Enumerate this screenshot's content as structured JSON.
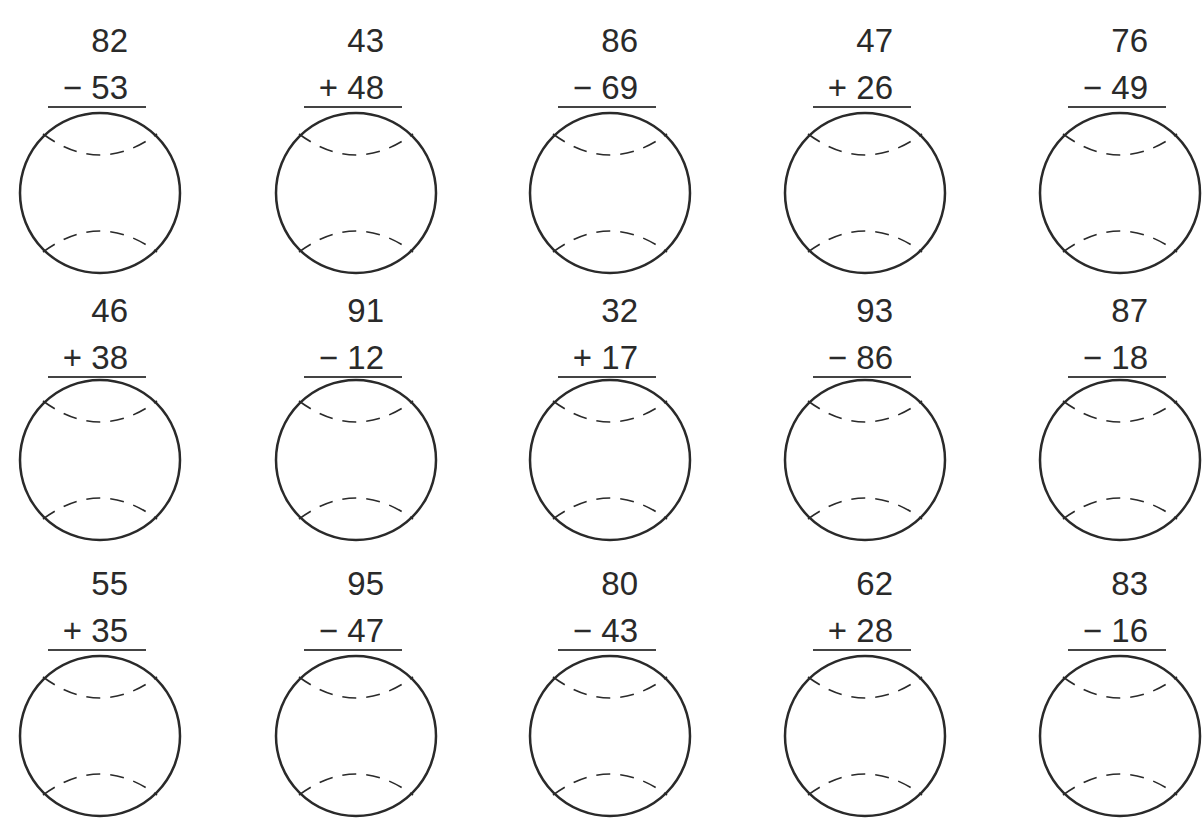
{
  "worksheet": {
    "type": "baseball two-digit addition and subtraction",
    "rows": [
      [
        {
          "top": "82",
          "operator": "−",
          "bottom": "53"
        },
        {
          "top": "43",
          "operator": "+",
          "bottom": "48"
        },
        {
          "top": "86",
          "operator": "−",
          "bottom": "69"
        },
        {
          "top": "47",
          "operator": "+",
          "bottom": "26"
        },
        {
          "top": "76",
          "operator": "−",
          "bottom": "49"
        }
      ],
      [
        {
          "top": "46",
          "operator": "+",
          "bottom": "38"
        },
        {
          "top": "91",
          "operator": "−",
          "bottom": "12"
        },
        {
          "top": "32",
          "operator": "+",
          "bottom": "17"
        },
        {
          "top": "93",
          "operator": "−",
          "bottom": "86"
        },
        {
          "top": "87",
          "operator": "−",
          "bottom": "18"
        }
      ],
      [
        {
          "top": "55",
          "operator": "+",
          "bottom": "35"
        },
        {
          "top": "95",
          "operator": "−",
          "bottom": "47"
        },
        {
          "top": "80",
          "operator": "−",
          "bottom": "43"
        },
        {
          "top": "62",
          "operator": "+",
          "bottom": "28"
        },
        {
          "top": "83",
          "operator": "−",
          "bottom": "16"
        }
      ]
    ],
    "icon": "baseball-icon",
    "colors": {
      "ink": "#2a2a2a",
      "paper": "#ffffff"
    }
  }
}
